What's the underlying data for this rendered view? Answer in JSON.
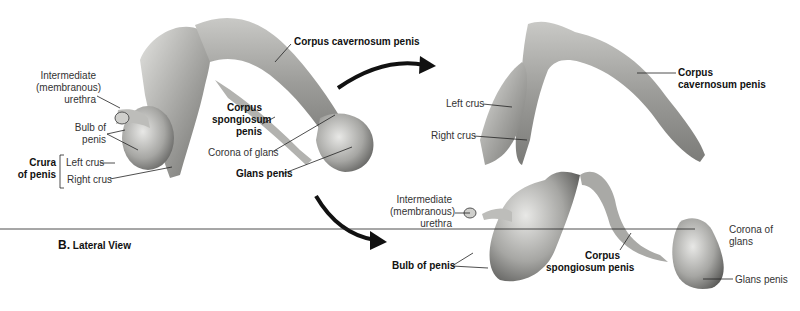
{
  "figure": {
    "caption_letter": "B.",
    "caption_text": "Lateral View"
  },
  "panels": {
    "intact": {
      "labels": {
        "intermediate_urethra": [
          "Intermediate",
          "(membranous)",
          "urethra"
        ],
        "bulb": [
          "Bulb of",
          "penis"
        ],
        "crura_group": [
          "Crura",
          "of penis"
        ],
        "left_crus": "Left crus",
        "right_crus": "Right crus",
        "corpus_cavernosum": "Corpus cavernosum penis",
        "corpus_spongiosum": [
          "Corpus",
          "spongiosum",
          "penis"
        ],
        "corona": "Corona of glans",
        "glans": "Glans penis"
      }
    },
    "cavernosa": {
      "labels": {
        "left_crus": "Left crus",
        "right_crus": "Right crus",
        "corpus_cavernosum": [
          "Corpus",
          "cavernosum penis"
        ]
      }
    },
    "spongiosum": {
      "labels": {
        "intermediate_urethra": [
          "Intermediate",
          "(membranous)",
          "urethra"
        ],
        "bulb": "Bulb of penis",
        "corpus_spongiosum": [
          "Corpus",
          "spongiosum penis"
        ],
        "corona": [
          "Corona of",
          "glans"
        ],
        "glans": "Glans penis"
      }
    }
  },
  "colors": {
    "tissue_light": "#d9d9d6",
    "tissue_mid": "#a9a9a6",
    "tissue_dark": "#6e6e6c",
    "arrow": "#111111",
    "leader": "#222222"
  }
}
